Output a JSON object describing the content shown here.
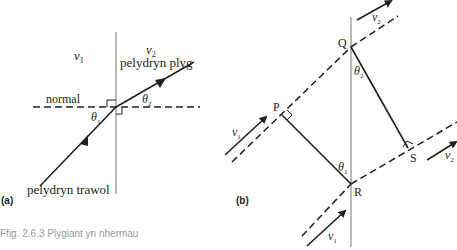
{
  "panel_a": {
    "label": "(a)",
    "medium1_speed": "v",
    "medium1_sub": "1",
    "medium2_speed": "v",
    "medium2_sub": "2",
    "refracted_ray_label": "pelydryn plyg",
    "incident_ray_label": "pelydryn trawol",
    "normal_label": "normal",
    "angle1": "θ",
    "angle1_sub": "1",
    "angle2": "θ",
    "angle2_sub": "2"
  },
  "panel_b": {
    "label": "(b)",
    "points": {
      "P": "P",
      "Q": "Q",
      "R": "R",
      "S": "S"
    },
    "v1_top_label": "v",
    "v1_top_sub": "1",
    "v1_bottom_label": "v",
    "v1_bottom_sub": "1",
    "v2_top_label": "v",
    "v2_top_sub": "2",
    "v2_right_label": "v",
    "v2_right_sub": "2",
    "angle1": "θ",
    "angle1_sub": "1",
    "angle2": "θ",
    "angle2_sub": "2"
  },
  "caption": {
    "line1": "Ffig. 2.6.3 Plygiant yn nhermau"
  },
  "colors": {
    "ink": "#231f20",
    "boundary": "#8a8a8a",
    "caption": "#9a9a9a"
  }
}
